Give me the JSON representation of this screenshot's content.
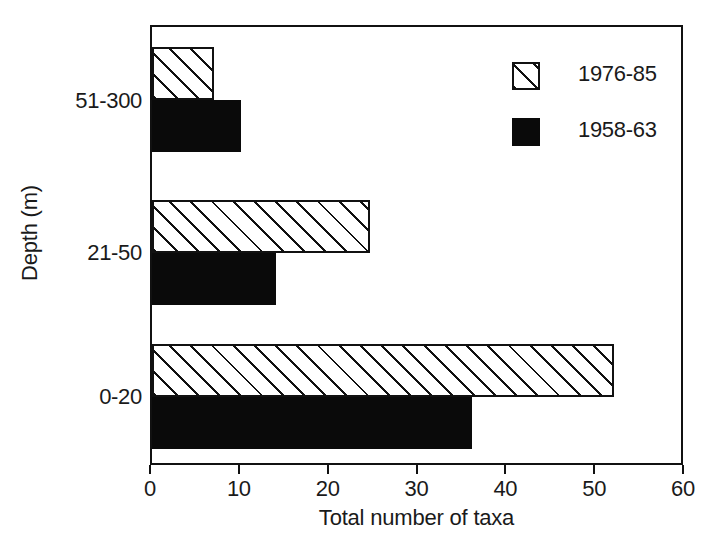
{
  "chart_data": {
    "type": "bar",
    "orientation": "horizontal",
    "title": "",
    "xlabel": "Total number of taxa",
    "ylabel": "Depth (m)",
    "categories": [
      "0-20",
      "21-50",
      "51-300"
    ],
    "series": [
      {
        "name": "1976-85",
        "pattern": "hatched",
        "values": [
          52,
          24.5,
          7
        ]
      },
      {
        "name": "1958-63",
        "pattern": "solid",
        "values": [
          36,
          14,
          10
        ]
      }
    ],
    "xlim": [
      0,
      60
    ],
    "xticks": [
      0,
      10,
      20,
      30,
      40,
      50,
      60
    ],
    "xtick_labels": [
      "0",
      "10",
      "20",
      "30",
      "40",
      "50",
      "60"
    ],
    "grid": false,
    "legend_position": "top-right",
    "colors": {
      "line": "#111111",
      "solid_fill": "#0a0a0a",
      "hatched_fill": "#ffffff",
      "background": "#ffffff",
      "text": "#1a1a1a"
    }
  },
  "legend": {
    "entries": [
      {
        "label": "1976-85",
        "swatch": "hatched-swatch-icon"
      },
      {
        "label": "1958-63",
        "swatch": "solid-swatch-icon"
      }
    ]
  },
  "axes": {
    "x": {
      "title": "Total number of taxa",
      "tick_labels": [
        "0",
        "10",
        "20",
        "30",
        "40",
        "50",
        "60"
      ]
    },
    "y": {
      "title": "Depth (m)",
      "tick_labels": [
        "51-300",
        "21-50",
        "0-20"
      ]
    }
  }
}
